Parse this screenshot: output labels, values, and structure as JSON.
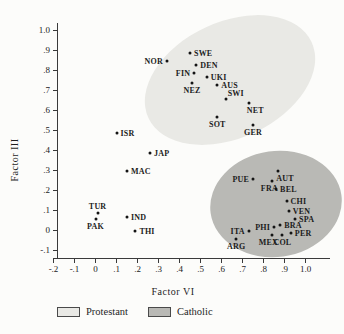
{
  "figure": {
    "colors": {
      "background": "#fcfcfa",
      "axis": "#3a3a3a",
      "ink": "#1c1c1c",
      "protestant": "#e9e9e5",
      "catholic": "#b9b9b5"
    }
  },
  "chart_data": {
    "type": "scatter",
    "title": "",
    "xlabel": "Factor VI",
    "ylabel": "Factor III",
    "xlim": [
      -0.2,
      1.0
    ],
    "ylim": [
      -0.1,
      1.0
    ],
    "grid": false,
    "x_ticks": [
      {
        "label": "-.2",
        "value": -0.2
      },
      {
        "label": "-.1",
        "value": -0.1
      },
      {
        "label": "0",
        "value": 0
      },
      {
        "label": ".1",
        "value": 0.1
      },
      {
        "label": ".2",
        "value": 0.2
      },
      {
        "label": ".3",
        "value": 0.3
      },
      {
        "label": ".4",
        "value": 0.4
      },
      {
        "label": ".5",
        "value": 0.5
      },
      {
        "label": ".6",
        "value": 0.6
      },
      {
        "label": ".7",
        "value": 0.7
      },
      {
        "label": ".8",
        "value": 0.8
      },
      {
        "label": ".9",
        "value": 0.9
      },
      {
        "label": "1.0",
        "value": 1.0
      }
    ],
    "y_ticks": [
      {
        "label": "1.0",
        "value": 1.0
      },
      {
        "label": ".9",
        "value": 0.9
      },
      {
        "label": ".8",
        "value": 0.8
      },
      {
        "label": ".7",
        "value": 0.7
      },
      {
        "label": ".6",
        "value": 0.6
      },
      {
        "label": ".5",
        "value": 0.5
      },
      {
        "label": ".4",
        "value": 0.4
      },
      {
        "label": ".3",
        "value": 0.3
      },
      {
        "label": ".2",
        "value": 0.2
      },
      {
        "label": ".1",
        "value": 0.1
      },
      {
        "label": "0",
        "value": 0
      },
      {
        "label": "-.1",
        "value": -0.1
      }
    ],
    "legend": {
      "position": "bottom",
      "items": [
        "Protestant",
        "Catholic"
      ]
    },
    "groups": [
      {
        "name": "Protestant",
        "fill": "#e9e9e5",
        "region_px": {
          "cx": 230,
          "cy": 80,
          "rx": 90,
          "ry": 58,
          "rotate_deg": -25
        },
        "points": [
          {
            "label": "NOR",
            "x": 0.34,
            "y": 0.85,
            "label_pos": "left"
          },
          {
            "label": "SWE",
            "x": 0.45,
            "y": 0.89,
            "label_pos": "right"
          },
          {
            "label": "DEN",
            "x": 0.48,
            "y": 0.83,
            "label_pos": "right"
          },
          {
            "label": "FIN",
            "x": 0.47,
            "y": 0.79,
            "label_pos": "left"
          },
          {
            "label": "UKI",
            "x": 0.53,
            "y": 0.77,
            "label_pos": "right"
          },
          {
            "label": "NEZ",
            "x": 0.46,
            "y": 0.74,
            "label_pos": "below"
          },
          {
            "label": "AUS",
            "x": 0.58,
            "y": 0.73,
            "label_pos": "right"
          },
          {
            "label": "SWI",
            "x": 0.62,
            "y": 0.66,
            "label_pos": "above-right"
          },
          {
            "label": "NET",
            "x": 0.73,
            "y": 0.64,
            "label_pos": "below-right"
          },
          {
            "label": "SOT",
            "x": 0.58,
            "y": 0.57,
            "label_pos": "below"
          },
          {
            "label": "GER",
            "x": 0.75,
            "y": 0.53,
            "label_pos": "below"
          }
        ]
      },
      {
        "name": "Catholic",
        "fill": "#b9b9b5",
        "region_px": {
          "cx": 276,
          "cy": 204,
          "rx": 66,
          "ry": 53,
          "rotate_deg": -8
        },
        "points": [
          {
            "label": "AUT",
            "x": 0.87,
            "y": 0.3,
            "label_pos": "below-right"
          },
          {
            "label": "PUE",
            "x": 0.75,
            "y": 0.26,
            "label_pos": "left"
          },
          {
            "label": "FRA",
            "x": 0.84,
            "y": 0.25,
            "label_pos": "below-left"
          },
          {
            "label": "BEL",
            "x": 0.86,
            "y": 0.21,
            "label_pos": "right"
          },
          {
            "label": "CHI",
            "x": 0.91,
            "y": 0.15,
            "label_pos": "right"
          },
          {
            "label": "VEN",
            "x": 0.92,
            "y": 0.1,
            "label_pos": "right"
          },
          {
            "label": "SPA",
            "x": 0.95,
            "y": 0.06,
            "label_pos": "right"
          },
          {
            "label": "PHI",
            "x": 0.85,
            "y": 0.02,
            "label_pos": "left"
          },
          {
            "label": "BRA",
            "x": 0.88,
            "y": 0.03,
            "label_pos": "right"
          },
          {
            "label": "PER",
            "x": 0.93,
            "y": -0.01,
            "label_pos": "right"
          },
          {
            "label": "MEX",
            "x": 0.84,
            "y": -0.02,
            "label_pos": "below-left"
          },
          {
            "label": "COL",
            "x": 0.89,
            "y": -0.02,
            "label_pos": "below"
          },
          {
            "label": "ITA",
            "x": 0.73,
            "y": 0.0,
            "label_pos": "left"
          },
          {
            "label": "ARG",
            "x": 0.67,
            "y": -0.04,
            "label_pos": "below"
          }
        ]
      },
      {
        "name": "Unclustered",
        "fill": null,
        "region_px": null,
        "points": [
          {
            "label": "ISR",
            "x": 0.1,
            "y": 0.49,
            "label_pos": "right"
          },
          {
            "label": "JAP",
            "x": 0.26,
            "y": 0.39,
            "label_pos": "right"
          },
          {
            "label": "MAC",
            "x": 0.15,
            "y": 0.3,
            "label_pos": "right"
          },
          {
            "label": "TUR",
            "x": 0.01,
            "y": 0.09,
            "label_pos": "above"
          },
          {
            "label": "PAK",
            "x": 0.0,
            "y": 0.06,
            "label_pos": "below"
          },
          {
            "label": "IND",
            "x": 0.15,
            "y": 0.07,
            "label_pos": "right"
          },
          {
            "label": "THI",
            "x": 0.19,
            "y": 0.0,
            "label_pos": "right"
          }
        ]
      }
    ]
  }
}
